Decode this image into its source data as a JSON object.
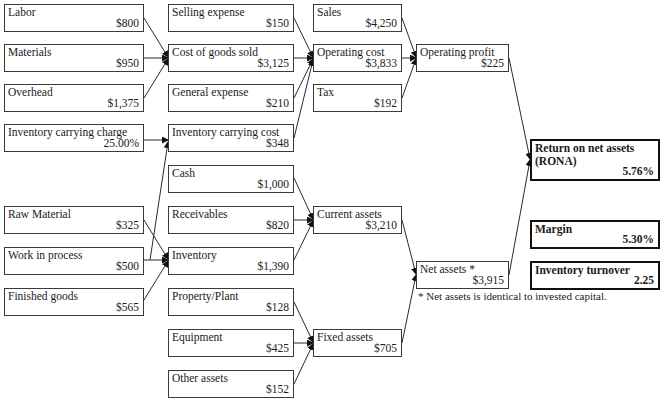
{
  "diagram": {
    "type": "financial-tree",
    "columns": [
      {
        "id": "col1",
        "nodes": [
          {
            "id": "labor",
            "label": "Labor",
            "value": "$800"
          },
          {
            "id": "materials",
            "label": "Materials",
            "value": "$950"
          },
          {
            "id": "overhead",
            "label": "Overhead",
            "value": "$1,375"
          },
          {
            "id": "inventory-carrying-charge",
            "label": "Inventory carrying charge",
            "value": "25.00%"
          },
          {
            "id": "raw-material",
            "label": "Raw Material",
            "value": "$325"
          },
          {
            "id": "work-in-process",
            "label": "Work in process",
            "value": "$500"
          },
          {
            "id": "finished-goods",
            "label": "Finished goods",
            "value": "$565"
          }
        ]
      },
      {
        "id": "col2",
        "nodes": [
          {
            "id": "selling-expense",
            "label": "Selling expense",
            "value": "$150"
          },
          {
            "id": "cost-of-goods-sold",
            "label": "Cost of goods sold",
            "value": "$3,125"
          },
          {
            "id": "general-expense",
            "label": "General expense",
            "value": "$210"
          },
          {
            "id": "inventory-carrying-cost",
            "label": "Inventory carrying cost",
            "value": "$348"
          },
          {
            "id": "cash",
            "label": "Cash",
            "value": "$1,000"
          },
          {
            "id": "receivables",
            "label": "Receivables",
            "value": "$820"
          },
          {
            "id": "inventory",
            "label": "Inventory",
            "value": "$1,390"
          },
          {
            "id": "property-plant",
            "label": "Property/Plant",
            "value": "$128"
          },
          {
            "id": "equipment",
            "label": "Equipment",
            "value": "$425"
          },
          {
            "id": "other-assets",
            "label": "Other assets",
            "value": "$152"
          }
        ]
      },
      {
        "id": "col3",
        "nodes": [
          {
            "id": "sales",
            "label": "Sales",
            "value": "$4,250"
          },
          {
            "id": "operating-cost",
            "label": "Operating cost",
            "value": "$3,833"
          },
          {
            "id": "tax",
            "label": "Tax",
            "value": "$192"
          },
          {
            "id": "current-assets",
            "label": "Current assets",
            "value": "$3,210"
          },
          {
            "id": "fixed-assets",
            "label": "Fixed assets",
            "value": "$705"
          }
        ]
      },
      {
        "id": "col4",
        "nodes": [
          {
            "id": "operating-profit",
            "label": "Operating profit",
            "value": "$225"
          },
          {
            "id": "net-assets",
            "label": "Net assets *",
            "value": "$3,915"
          }
        ]
      },
      {
        "id": "col5",
        "nodes": [
          {
            "id": "rona",
            "label": "Return on net assets (RONA)",
            "value": "5.76%"
          },
          {
            "id": "margin",
            "label": "Margin",
            "value": "5.30%"
          },
          {
            "id": "inventory-turnover",
            "label": "Inventory turnover",
            "value": "2.25"
          }
        ]
      }
    ],
    "edges": [
      [
        "labor",
        "cost-of-goods-sold"
      ],
      [
        "materials",
        "cost-of-goods-sold"
      ],
      [
        "overhead",
        "cost-of-goods-sold"
      ],
      [
        "inventory-carrying-charge",
        "inventory-carrying-cost"
      ],
      [
        "inventory",
        "inventory-carrying-cost"
      ],
      [
        "raw-material",
        "inventory"
      ],
      [
        "work-in-process",
        "inventory"
      ],
      [
        "finished-goods",
        "inventory"
      ],
      [
        "selling-expense",
        "operating-cost"
      ],
      [
        "cost-of-goods-sold",
        "operating-cost"
      ],
      [
        "general-expense",
        "operating-cost"
      ],
      [
        "inventory-carrying-cost",
        "operating-cost"
      ],
      [
        "cash",
        "current-assets"
      ],
      [
        "receivables",
        "current-assets"
      ],
      [
        "inventory",
        "current-assets"
      ],
      [
        "property-plant",
        "fixed-assets"
      ],
      [
        "equipment",
        "fixed-assets"
      ],
      [
        "other-assets",
        "fixed-assets"
      ],
      [
        "sales",
        "operating-profit"
      ],
      [
        "operating-cost",
        "operating-profit"
      ],
      [
        "tax",
        "operating-profit"
      ],
      [
        "current-assets",
        "net-assets"
      ],
      [
        "fixed-assets",
        "net-assets"
      ],
      [
        "operating-profit",
        "rona"
      ],
      [
        "net-assets",
        "rona"
      ]
    ],
    "footnote": "* Net assets is identical to invested capital."
  },
  "colors": {
    "border": "#3a3a3a",
    "bold_border": "#111111",
    "text": "#1a1a1a",
    "background": "#ffffff"
  }
}
